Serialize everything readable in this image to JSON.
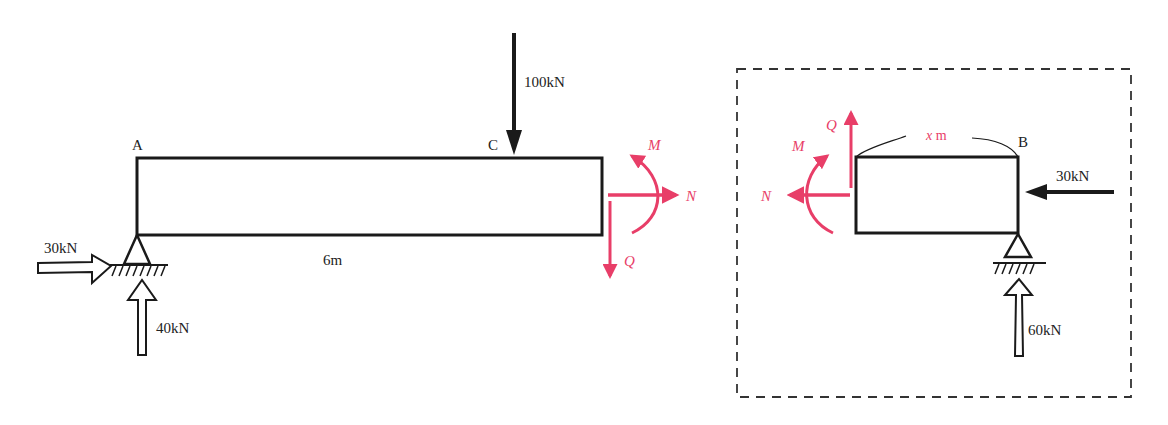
{
  "colors": {
    "ink": "#1a1a1a",
    "internal_force": "#e83e68",
    "background": "#ffffff"
  },
  "left_diagram": {
    "beam": {
      "length_label": "6m"
    },
    "points": {
      "a": "A",
      "c": "C"
    },
    "loads": {
      "point_load": "100kN",
      "horizontal_reaction_a": "30kN",
      "vertical_reaction_a": "40kN"
    },
    "internal_forces": {
      "moment": "M",
      "axial": "N",
      "shear": "Q"
    }
  },
  "right_diagram": {
    "segment_length_label_var": "x",
    "segment_length_label_unit": " m",
    "points": {
      "b": "B"
    },
    "loads": {
      "horizontal_force_b": "30kN",
      "vertical_reaction_b": "60kN"
    },
    "internal_forces": {
      "moment": "M",
      "axial": "N",
      "shear": "Q"
    }
  }
}
